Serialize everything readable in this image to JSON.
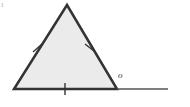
{
  "figure": {
    "name": "equilateral-triangle-exterior-angle",
    "canvas": {
      "width": 190,
      "height": 107
    },
    "background_color": "#ffffff",
    "triangle": {
      "fill_color": "#ebebeb",
      "stroke_color": "#333333",
      "stroke_width": 2.5,
      "vertices": [
        {
          "id": "apex",
          "x": 67,
          "y": 5
        },
        {
          "id": "bottom-left",
          "x": 14,
          "y": 89
        },
        {
          "id": "bottom-right",
          "x": 117,
          "y": 89
        }
      ],
      "points_attr": "67,5 14,89 117,89"
    },
    "baseline_extension": {
      "stroke_color": "#555555",
      "stroke_width": 1.5,
      "x1": 117,
      "y1": 89,
      "x2": 168,
      "y2": 89
    },
    "tick_marks": [
      {
        "id": "tick-left-side",
        "side": "left",
        "x1": 33,
        "y1": 52,
        "x2": 42,
        "y2": 44
      },
      {
        "id": "tick-right-side",
        "side": "right",
        "x1": 85,
        "y1": 44,
        "x2": 94,
        "y2": 51
      },
      {
        "id": "tick-base",
        "side": "base",
        "x1": 65,
        "y1": 83,
        "x2": 65,
        "y2": 95
      }
    ],
    "tick_stroke_color": "#333333",
    "tick_stroke_width": 1.4,
    "labels": {
      "exterior_angle": {
        "text": "o",
        "x": 118,
        "y": 71
      },
      "corner_artifact": {
        "text": "ı",
        "x": 1,
        "y": 0
      }
    }
  }
}
